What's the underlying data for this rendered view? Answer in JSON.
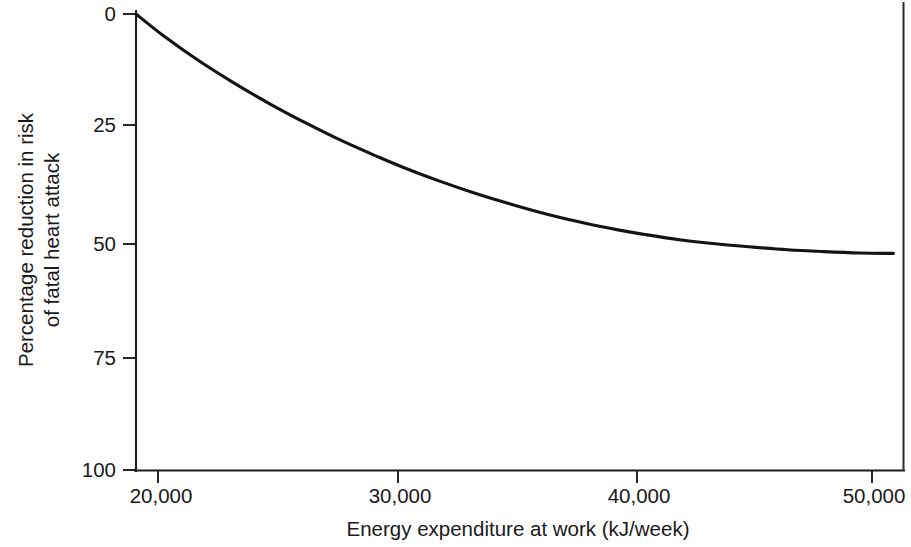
{
  "chart_data": {
    "type": "line",
    "title": "",
    "xlabel": "Energy expenditure at work (kJ/week)",
    "ylabel_line1": "Percentage reduction in risk",
    "ylabel_line2": "of fatal heart attack",
    "ylabel": "Percentage reduction in risk of fatal heart attack",
    "xlim": [
      18900,
      50800
    ],
    "ylim": [
      0,
      100
    ],
    "y_axis_inverted": true,
    "grid": false,
    "legend": null,
    "x_ticks": [
      20000,
      30000,
      40000,
      50000
    ],
    "x_tick_labels": [
      "20,000",
      "30,000",
      "40,000",
      "50,000"
    ],
    "y_ticks": [
      0,
      25,
      50,
      75,
      100
    ],
    "y_tick_labels": [
      "0",
      "25",
      "50",
      "75",
      "100"
    ],
    "series": [
      {
        "name": "Percentage reduction in risk of fatal heart attack",
        "color": "#141414",
        "x": [
          18900,
          20000,
          21500,
          23000,
          24500,
          26000,
          27500,
          29000,
          30000,
          31500,
          33000,
          34500,
          36000,
          37500,
          39000,
          40000,
          41500,
          43000,
          44500,
          46000,
          47500,
          49000,
          50400
        ],
        "values": [
          0,
          4.6,
          10.2,
          15.2,
          19.8,
          24.0,
          27.9,
          31.4,
          33.6,
          36.6,
          39.3,
          41.7,
          43.9,
          45.8,
          47.4,
          48.3,
          49.5,
          50.4,
          51.1,
          51.7,
          52.1,
          52.4,
          52.5
        ]
      }
    ],
    "colors": {
      "axis": "#1c1c1c",
      "curve": "#141414",
      "background": "#ffffff",
      "text": "#1a1a1a"
    }
  },
  "axes": {
    "y_tick_0": "0",
    "y_tick_25": "25",
    "y_tick_50": "50",
    "y_tick_75": "75",
    "y_tick_100": "100",
    "x_tick_20000": "20,000",
    "x_tick_30000": "30,000",
    "x_tick_40000": "40,000",
    "x_tick_50000": "50,000",
    "x_axis_title": "Energy expenditure at work (kJ/week)",
    "y_axis_title_line1": "Percentage reduction in risk",
    "y_axis_title_line2": "of fatal heart attack"
  }
}
